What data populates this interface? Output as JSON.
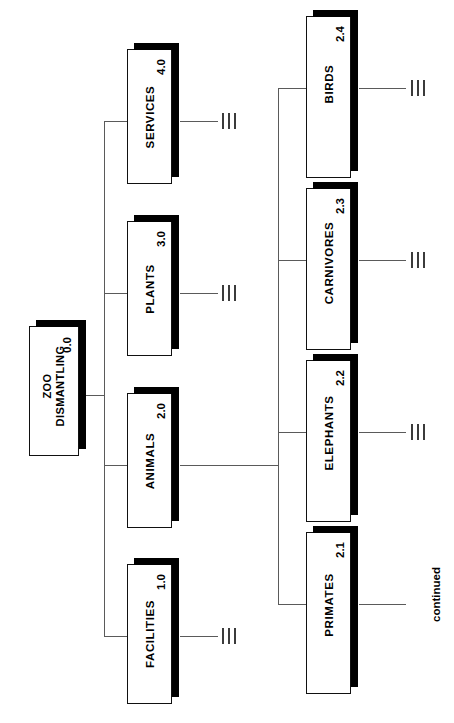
{
  "diagram": {
    "orientation": "rotated-90-ccw",
    "line_color": "#5a5a5a",
    "box_border_color": "#111111",
    "shadow_color": "#000000",
    "background": "#ffffff"
  },
  "nodes": {
    "root": {
      "code": "0.0",
      "line1": "ZOO",
      "line2": "DISMANTLING"
    },
    "facilities": {
      "code": "1.0",
      "label": "FACILITIES"
    },
    "animals": {
      "code": "2.0",
      "label": "ANIMALS"
    },
    "plants": {
      "code": "3.0",
      "label": "PLANTS"
    },
    "services": {
      "code": "4.0",
      "label": "SERVICES"
    },
    "primates": {
      "code": "2.1",
      "label": "PRIMATES"
    },
    "elephants": {
      "code": "2.2",
      "label": "ELEPHANTS"
    },
    "carnivores": {
      "code": "2.3",
      "label": "CARNIVORES"
    },
    "birds": {
      "code": "2.4",
      "label": "BIRDS"
    }
  },
  "annotations": {
    "continued": "continued"
  },
  "stub_marker": {
    "glyph": "|||",
    "count": 3
  }
}
